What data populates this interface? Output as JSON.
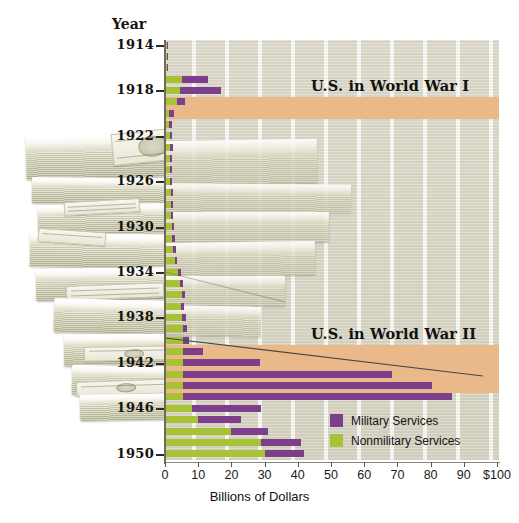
{
  "axes": {
    "y_title": "Year",
    "x_title": "Billions of Dollars",
    "x_ticks": [
      "0",
      "10",
      "20",
      "30",
      "40",
      "50",
      "60",
      "70",
      "80",
      "90",
      "$100"
    ],
    "year_ticks": [
      "1914",
      "1918",
      "1922",
      "1926",
      "1930",
      "1934",
      "1938",
      "1942",
      "1946",
      "1950"
    ]
  },
  "annotations": [
    {
      "text": "U.S. in World War I",
      "name": "ww1-band-label"
    },
    {
      "text": "U.S. in World War II",
      "name": "ww2-band-label"
    }
  ],
  "legend": {
    "items": [
      {
        "label": "Military Services",
        "color": "#7d3f8c",
        "key": "military"
      },
      {
        "label": "Nonmilitary Services",
        "color": "#a8c238",
        "key": "nonmilitary"
      }
    ]
  },
  "colors": {
    "military": "#7d3f8c",
    "nonmilitary": "#a8c238",
    "war_band": "#eab98a",
    "plot_background": "#d9d6c8",
    "axis": "#6e6b5c"
  },
  "chart_data": {
    "type": "bar",
    "orientation": "horizontal-stacked",
    "xlabel": "Billions of Dollars",
    "ylabel": "Year",
    "xlim": [
      0,
      100
    ],
    "ylim": [
      1914,
      1951
    ],
    "grid": true,
    "legend_position": "bottom-right",
    "categories": [
      1914,
      1915,
      1916,
      1917,
      1918,
      1919,
      1920,
      1921,
      1922,
      1923,
      1924,
      1925,
      1926,
      1927,
      1928,
      1929,
      1930,
      1931,
      1932,
      1933,
      1934,
      1935,
      1936,
      1937,
      1938,
      1939,
      1940,
      1941,
      1942,
      1943,
      1944,
      1945,
      1946,
      1947,
      1948,
      1949,
      1950
    ],
    "series": [
      {
        "name": "Nonmilitary Services",
        "color": "#a8c238",
        "values": [
          0.5,
          0.5,
          0.6,
          5.0,
          4.5,
          3.5,
          1.3,
          1.2,
          1.5,
          1.6,
          1.6,
          1.6,
          1.6,
          1.7,
          1.7,
          1.8,
          2.0,
          2.2,
          2.5,
          3.0,
          4.0,
          4.5,
          5.0,
          4.8,
          5.2,
          5.5,
          5.5,
          5.5,
          5.5,
          5.5,
          5.5,
          5.5,
          8.0,
          10.0,
          20.0,
          29.0,
          30.0
        ]
      },
      {
        "name": "Military Services",
        "color": "#7d3f8c",
        "values": [
          0.3,
          0.3,
          0.3,
          8.0,
          12.5,
          2.5,
          1.5,
          1.0,
          0.7,
          0.7,
          0.6,
          0.6,
          0.6,
          0.6,
          0.7,
          0.7,
          0.7,
          0.7,
          0.7,
          0.6,
          0.7,
          0.8,
          0.9,
          0.9,
          1.0,
          1.2,
          1.8,
          6.0,
          23.0,
          63.0,
          75.0,
          81.0,
          21.0,
          13.0,
          11.0,
          12.0,
          12.0
        ]
      }
    ],
    "war_bands": [
      {
        "label": "U.S. in World War I",
        "from_year": 1917,
        "to_year": 1918
      },
      {
        "label": "U.S. in World War II",
        "from_year": 1942,
        "to_year": 1945
      }
    ]
  }
}
